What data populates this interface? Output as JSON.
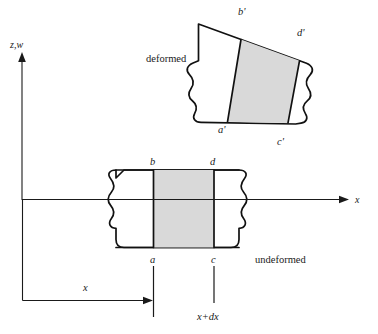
{
  "figure": {
    "axes": {
      "vertical_label": "z,w",
      "horizontal_label": "x"
    },
    "states": {
      "deformed_label": "deformed",
      "undeformed_label": "undeformed"
    },
    "corner_labels": {
      "undeformed": {
        "top_left": "b",
        "top_right": "d",
        "bottom_left": "a",
        "bottom_right": "c"
      },
      "deformed": {
        "top_left": "b'",
        "top_right": "d'",
        "bottom_left": "a'",
        "bottom_right": "c'"
      }
    },
    "dimensions": {
      "origin_to_a": "x",
      "origin_to_c": "x+dx"
    },
    "colors": {
      "element_fill": "#d9d9d9",
      "outline": "#111111",
      "axis": "#1a1a1a",
      "background": "#ffffff"
    },
    "margin_caption_fragments": [
      "",
      "",
      "",
      ""
    ]
  }
}
